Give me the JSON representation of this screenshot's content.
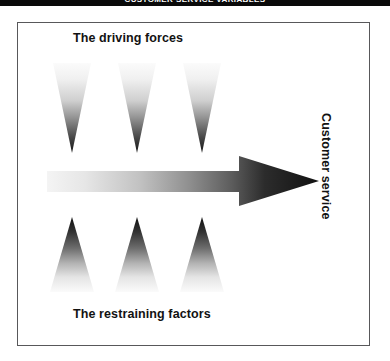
{
  "header": {
    "running_head": "CUSTOMER SERVICE VARIABLES"
  },
  "figure": {
    "driving_forces_label": "The driving forces",
    "restraining_factors_label": "The restraining factors",
    "outcome_label": "Customer service",
    "arrow": {
      "name": "rightward-gradient-arrow",
      "direction": "right",
      "gradient_from": "#f2f2f2",
      "gradient_to": "#141414"
    },
    "driving_force_wedges": [
      {
        "name": "driving-force-wedge-1",
        "orientation": "down",
        "gradient_from": "#f7f7f7",
        "gradient_to": "#1a1a1a"
      },
      {
        "name": "driving-force-wedge-2",
        "orientation": "down",
        "gradient_from": "#f7f7f7",
        "gradient_to": "#1a1a1a"
      },
      {
        "name": "driving-force-wedge-3",
        "orientation": "down",
        "gradient_from": "#f7f7f7",
        "gradient_to": "#1a1a1a"
      }
    ],
    "restraining_factor_wedges": [
      {
        "name": "restraining-factor-wedge-1",
        "orientation": "up",
        "gradient_from": "#141414",
        "gradient_to": "#fbfbfb"
      },
      {
        "name": "restraining-factor-wedge-2",
        "orientation": "up",
        "gradient_from": "#141414",
        "gradient_to": "#fbfbfb"
      },
      {
        "name": "restraining-factor-wedge-3",
        "orientation": "up",
        "gradient_from": "#141414",
        "gradient_to": "#fbfbfb"
      }
    ]
  },
  "colors": {
    "header_bar": "#0a0a0a",
    "header_text": "#ffffff",
    "frame_border": "#58585a",
    "text": "#121212",
    "page_background": "#ffffff"
  }
}
